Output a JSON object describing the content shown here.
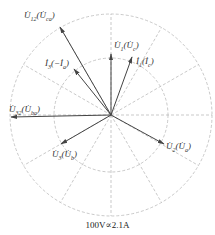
{
  "diagram": {
    "center": [
      111,
      115
    ],
    "outer_radius": 101,
    "inner_radius": 57,
    "radial_line_step_deg": 30,
    "grid_color": "#bbbbbb",
    "vector_color": "#444444",
    "vectors": [
      {
        "id": "U12",
        "name": "U12 (Uca)",
        "tip": [
          60,
          27
        ],
        "label": "U̇₁₂(U̇ca)",
        "label_main": "U̇",
        "label_sub": "12",
        "label_paren": "U̇",
        "label_paren_sub": "ca",
        "label_pos": [
          24,
          10
        ]
      },
      {
        "id": "I3",
        "name": "I3 (-Ia)",
        "tip": [
          74,
          69
        ],
        "label_main": "İ",
        "label_sub": "3",
        "label_paren": "−İ",
        "label_paren_sub": "a",
        "label_pos": [
          45,
          58
        ]
      },
      {
        "id": "U1",
        "name": "U1 (Uc)",
        "tip": [
          111,
          54
        ],
        "label_main": "U̇",
        "label_sub": "1",
        "label_paren": "U̇",
        "label_paren_sub": "c",
        "label_pos": [
          114,
          40
        ]
      },
      {
        "id": "I1",
        "name": "I1 (Ic)",
        "tip": [
          132,
          57
        ],
        "label_main": "İ",
        "label_sub": "1",
        "label_paren": "İ",
        "label_paren_sub": "c",
        "label_pos": [
          136,
          56
        ]
      },
      {
        "id": "U32",
        "name": "U32 (Uba)",
        "tip": [
          11,
          117
        ],
        "label_main": "U̇",
        "label_sub": "32",
        "label_paren": "U̇",
        "label_paren_sub": "ba",
        "label_pos": [
          9,
          104
        ]
      },
      {
        "id": "U3",
        "name": "U3 (Ub)",
        "tip": [
          61,
          144
        ],
        "label_main": "U̇",
        "label_sub": "3",
        "label_paren": "U̇",
        "label_paren_sub": "b",
        "label_pos": [
          52,
          149
        ]
      },
      {
        "id": "U2",
        "name": "U2 (Ua)",
        "tip": [
          164,
          144
        ],
        "label_main": "U̇",
        "label_sub": "2",
        "label_paren": "U̇",
        "label_paren_sub": "a",
        "label_pos": [
          166,
          141
        ]
      }
    ],
    "caption": "100V∝2.1A"
  }
}
